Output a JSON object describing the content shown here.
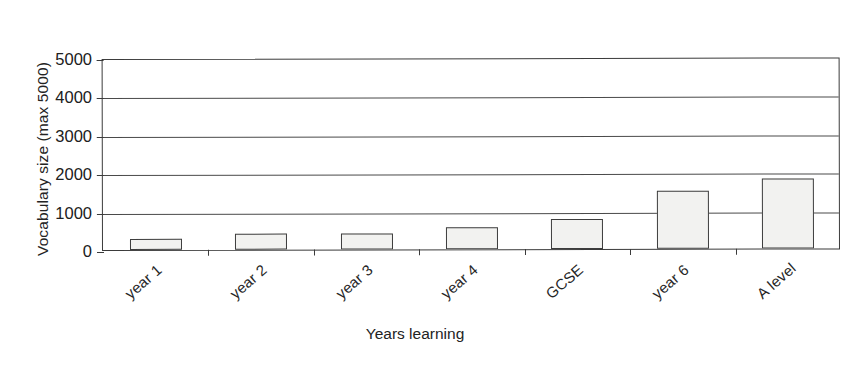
{
  "chart_data": {
    "type": "bar",
    "title": "",
    "xlabel": "Years learning",
    "ylabel": "Vocabulary size (max 5000)",
    "categories": [
      "year 1",
      "year 2",
      "year 3",
      "year 4",
      "GCSE",
      "year 6",
      "A level"
    ],
    "values": [
      290,
      420,
      430,
      570,
      790,
      1520,
      1830
    ],
    "ylim": [
      0,
      5000
    ],
    "yticks": [
      0,
      1000,
      2000,
      3000,
      4000,
      5000
    ],
    "yticklabels": [
      "0",
      "1000",
      "2000",
      "3000",
      "4000",
      "5000"
    ],
    "grid": "horizontal",
    "legend": "none",
    "series": [
      {
        "name": "Vocabulary size",
        "values": [
          290,
          420,
          430,
          570,
          790,
          1520,
          1830
        ],
        "fill_color": "#f2f2f0",
        "edge_color": "#3d3d3d"
      }
    ]
  },
  "style": {
    "background": "#ffffff",
    "axis_color": "#3b3b3b",
    "gridline_color": "#4a4a4a",
    "text_color": "#232323"
  }
}
